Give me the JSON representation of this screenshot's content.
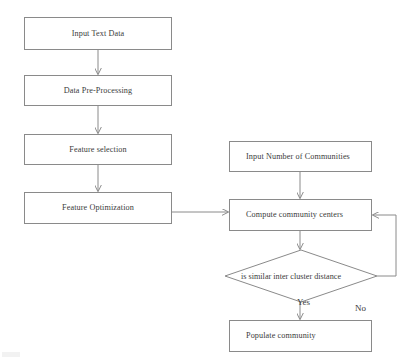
{
  "diagram": {
    "style": {
      "stroke_color": "#8a8a8a",
      "text_color": "#3b3b3b",
      "background": "#ffffff"
    },
    "nodes": [
      {
        "id": "input_text_data",
        "label": "Input Text Data",
        "shape": "rectangle"
      },
      {
        "id": "data_pre_processing",
        "label": "Data Pre-Processing",
        "shape": "rectangle"
      },
      {
        "id": "feature_selection",
        "label": "Feature selection",
        "shape": "rectangle"
      },
      {
        "id": "feature_optimization",
        "label": "Feature Optimization",
        "shape": "rectangle"
      },
      {
        "id": "input_num_communities",
        "label": "Input Number of Communities",
        "shape": "rectangle"
      },
      {
        "id": "compute_centers",
        "label": "Compute community centers",
        "shape": "rectangle"
      },
      {
        "id": "decision",
        "label": "is similar inter cluster distance",
        "shape": "diamond"
      },
      {
        "id": "populate_community",
        "label": "Populate community",
        "shape": "rectangle"
      }
    ],
    "edge_labels": {
      "no": "No",
      "yes": "Yes"
    },
    "edges": [
      {
        "from": "input_text_data",
        "to": "data_pre_processing",
        "label": ""
      },
      {
        "from": "data_pre_processing",
        "to": "feature_selection",
        "label": ""
      },
      {
        "from": "feature_selection",
        "to": "feature_optimization",
        "label": ""
      },
      {
        "from": "feature_optimization",
        "to": "compute_centers",
        "label": ""
      },
      {
        "from": "input_num_communities",
        "to": "compute_centers",
        "label": ""
      },
      {
        "from": "compute_centers",
        "to": "decision",
        "label": ""
      },
      {
        "from": "decision",
        "to": "compute_centers",
        "label": "No"
      },
      {
        "from": "decision",
        "to": "populate_community",
        "label": "Yes"
      }
    ]
  }
}
